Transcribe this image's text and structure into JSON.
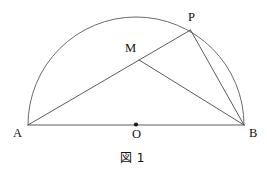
{
  "figure": {
    "caption": "図 1",
    "type": "semicircle-geometry-diagram",
    "labels": {
      "A": "A",
      "B": "B",
      "O": "O",
      "P": "P",
      "M": "M"
    },
    "colors": {
      "stroke": "#4a4a4a",
      "arc_stroke": "#5a5a5a",
      "text": "#111111",
      "background": "#ffffff",
      "dot": "#1a1a1a"
    },
    "points": {
      "A": {
        "x": 28,
        "y": 125
      },
      "B": {
        "x": 244,
        "y": 125
      },
      "O": {
        "x": 136,
        "y": 125
      },
      "P": {
        "x": 190,
        "y": 30
      },
      "M": {
        "x": 139,
        "y": 60
      }
    },
    "circle": {
      "center_x": 136,
      "center_y": 125,
      "radius": 108
    },
    "segments": [
      {
        "name": "diameter-AB",
        "from": "A",
        "to": "B"
      },
      {
        "name": "chord-AP",
        "from": "A",
        "to": "P"
      },
      {
        "name": "chord-PB",
        "from": "P",
        "to": "B"
      },
      {
        "name": "segment-MB",
        "from": "M",
        "to": "B"
      }
    ],
    "arcs": [
      {
        "name": "semicircular-arc-AB",
        "from": "A",
        "to": "B",
        "sweep": "upper"
      }
    ]
  }
}
